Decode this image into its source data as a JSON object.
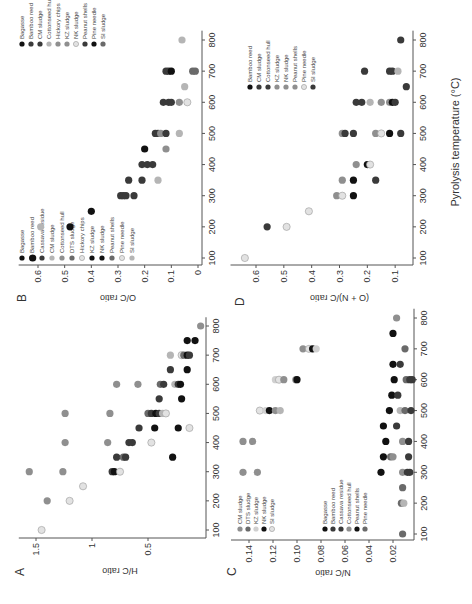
{
  "figure": {
    "xlabel": "Pyrolysis temperature (°C)",
    "panels": [
      "A",
      "B",
      "C",
      "D"
    ]
  },
  "colors": {
    "black": "#111111",
    "dark": "#3a3a3a",
    "mid": "#6a6a6a",
    "gray": "#8f8f8f",
    "light": "#b5b5b5",
    "open": "#e2e2e2"
  },
  "chart_data": [
    {
      "panel": "A",
      "type": "scatter",
      "title": "",
      "xlabel": "Pyrolysis temperature (°C)",
      "ylabel": "H/C ratio",
      "xlim": [
        70,
        830
      ],
      "ylim": [
        0,
        1.6
      ],
      "xticks": [
        100,
        200,
        300,
        400,
        500,
        600,
        700,
        800
      ],
      "yticks": [
        0.5,
        1,
        1.5
      ],
      "ytick_labels": [
        "0.5",
        "1",
        "1.5"
      ],
      "legend": [
        "Bagasse",
        "Bamboo reed",
        "Cassava residue",
        "CM sludge",
        "Cottonseed hull",
        "DTS sludge",
        "Hickory chips",
        "KZ sludge",
        "NK sludge",
        "Peanut shells",
        "Pine needle",
        "SI sludge"
      ],
      "legend_colors": [
        "#111111",
        "#3a3a3a",
        "#3a3a3a",
        "#b5b5b5",
        "#8f8f8f",
        "#6a6a6a",
        "#e2e2e2",
        "#111111",
        "#111111",
        "#6a6a6a",
        "#e2e2e2",
        "#b5b5b5"
      ],
      "points": [
        {
          "x": 100,
          "y": 1.45,
          "c": "#e2e2e2"
        },
        {
          "x": 200,
          "y": 1.4,
          "c": "#8f8f8f"
        },
        {
          "x": 200,
          "y": 1.2,
          "c": "#e2e2e2"
        },
        {
          "x": 250,
          "y": 1.08,
          "c": "#e2e2e2"
        },
        {
          "x": 300,
          "y": 1.56,
          "c": "#8f8f8f"
        },
        {
          "x": 300,
          "y": 1.26,
          "c": "#8f8f8f"
        },
        {
          "x": 300,
          "y": 0.82,
          "c": "#3a3a3a"
        },
        {
          "x": 300,
          "y": 0.8,
          "c": "#111111"
        },
        {
          "x": 300,
          "y": 0.75,
          "c": "#e2e2e2"
        },
        {
          "x": 350,
          "y": 0.78,
          "c": "#3a3a3a"
        },
        {
          "x": 350,
          "y": 0.72,
          "c": "#6a6a6a"
        },
        {
          "x": 350,
          "y": 0.7,
          "c": "#3a3a3a"
        },
        {
          "x": 350,
          "y": 0.28,
          "c": "#111111"
        },
        {
          "x": 400,
          "y": 1.24,
          "c": "#8f8f8f"
        },
        {
          "x": 400,
          "y": 0.86,
          "c": "#8f8f8f"
        },
        {
          "x": 400,
          "y": 0.67,
          "c": "#3a3a3a"
        },
        {
          "x": 400,
          "y": 0.64,
          "c": "#3a3a3a"
        },
        {
          "x": 400,
          "y": 0.47,
          "c": "#e2e2e2"
        },
        {
          "x": 450,
          "y": 0.58,
          "c": "#3a3a3a"
        },
        {
          "x": 450,
          "y": 0.44,
          "c": "#111111"
        },
        {
          "x": 450,
          "y": 0.23,
          "c": "#111111"
        },
        {
          "x": 450,
          "y": 0.13,
          "c": "#e2e2e2"
        },
        {
          "x": 500,
          "y": 1.24,
          "c": "#8f8f8f"
        },
        {
          "x": 500,
          "y": 0.84,
          "c": "#8f8f8f"
        },
        {
          "x": 500,
          "y": 0.5,
          "c": "#6a6a6a"
        },
        {
          "x": 500,
          "y": 0.47,
          "c": "#3a3a3a"
        },
        {
          "x": 500,
          "y": 0.43,
          "c": "#111111"
        },
        {
          "x": 500,
          "y": 0.4,
          "c": "#3a3a3a"
        },
        {
          "x": 500,
          "y": 0.37,
          "c": "#b5b5b5"
        },
        {
          "x": 500,
          "y": 0.34,
          "c": "#e2e2e2"
        },
        {
          "x": 550,
          "y": 0.4,
          "c": "#3a3a3a"
        },
        {
          "x": 550,
          "y": 0.2,
          "c": "#111111"
        },
        {
          "x": 600,
          "y": 0.78,
          "c": "#8f8f8f"
        },
        {
          "x": 600,
          "y": 0.59,
          "c": "#8f8f8f"
        },
        {
          "x": 600,
          "y": 0.39,
          "c": "#6a6a6a"
        },
        {
          "x": 600,
          "y": 0.36,
          "c": "#3a3a3a"
        },
        {
          "x": 600,
          "y": 0.26,
          "c": "#b5b5b5"
        },
        {
          "x": 600,
          "y": 0.23,
          "c": "#3a3a3a"
        },
        {
          "x": 600,
          "y": 0.21,
          "c": "#111111"
        },
        {
          "x": 650,
          "y": 0.3,
          "c": "#3a3a3a"
        },
        {
          "x": 650,
          "y": 0.15,
          "c": "#111111"
        },
        {
          "x": 700,
          "y": 0.3,
          "c": "#b5b5b5"
        },
        {
          "x": 700,
          "y": 0.2,
          "c": "#e2e2e2"
        },
        {
          "x": 700,
          "y": 0.18,
          "c": "#6a6a6a"
        },
        {
          "x": 700,
          "y": 0.15,
          "c": "#111111"
        },
        {
          "x": 700,
          "y": 0.13,
          "c": "#3a3a3a"
        },
        {
          "x": 750,
          "y": 0.15,
          "c": "#111111"
        },
        {
          "x": 750,
          "y": 0.08,
          "c": "#111111"
        },
        {
          "x": 800,
          "y": 0.03,
          "c": "#8f8f8f"
        }
      ]
    },
    {
      "panel": "B",
      "type": "scatter",
      "title": "",
      "xlabel": "Pyrolysis temperature (°C)",
      "ylabel": "O/C ratio",
      "xlim": [
        70,
        830
      ],
      "ylim": [
        0,
        0.65
      ],
      "xticks": [
        100,
        200,
        300,
        400,
        500,
        600,
        700,
        800
      ],
      "yticks": [
        0,
        0.1,
        0.2,
        0.3,
        0.4,
        0.5,
        0.6
      ],
      "ytick_labels": [
        "0",
        "0.1",
        "0.2",
        "0.3",
        "0.4",
        "0.5",
        "0.6"
      ],
      "legend": [
        "Bagasse",
        "Bamboo reed",
        "CM sludge",
        "Cottonseed hull",
        "Hickory chips",
        "KZ sludge",
        "NK sludge",
        "Peanut shells",
        "Pine needle",
        "SI sludge"
      ],
      "legend_colors": [
        "#111111",
        "#3a3a3a",
        "#3a3a3a",
        "#b5b5b5",
        "#8f8f8f",
        "#8f8f8f",
        "#e2e2e2",
        "#3a3a3a",
        "#111111",
        "#6a6a6a"
      ],
      "points": [
        {
          "x": 100,
          "y": 0.62,
          "c": "#111111"
        },
        {
          "x": 200,
          "y": 0.59,
          "c": "#b5b5b5"
        },
        {
          "x": 200,
          "y": 0.48,
          "c": "#111111"
        },
        {
          "x": 250,
          "y": 0.4,
          "c": "#111111"
        },
        {
          "x": 300,
          "y": 0.29,
          "c": "#3a3a3a"
        },
        {
          "x": 300,
          "y": 0.28,
          "c": "#3a3a3a"
        },
        {
          "x": 300,
          "y": 0.27,
          "c": "#3a3a3a"
        },
        {
          "x": 300,
          "y": 0.24,
          "c": "#3a3a3a"
        },
        {
          "x": 350,
          "y": 0.26,
          "c": "#3a3a3a"
        },
        {
          "x": 350,
          "y": 0.21,
          "c": "#3a3a3a"
        },
        {
          "x": 350,
          "y": 0.15,
          "c": "#b5b5b5"
        },
        {
          "x": 400,
          "y": 0.21,
          "c": "#3a3a3a"
        },
        {
          "x": 400,
          "y": 0.19,
          "c": "#3a3a3a"
        },
        {
          "x": 400,
          "y": 0.17,
          "c": "#3a3a3a"
        },
        {
          "x": 450,
          "y": 0.2,
          "c": "#111111"
        },
        {
          "x": 450,
          "y": 0.12,
          "c": "#8f8f8f"
        },
        {
          "x": 500,
          "y": 0.16,
          "c": "#3a3a3a"
        },
        {
          "x": 500,
          "y": 0.15,
          "c": "#3a3a3a"
        },
        {
          "x": 500,
          "y": 0.14,
          "c": "#8f8f8f"
        },
        {
          "x": 500,
          "y": 0.12,
          "c": "#3a3a3a"
        },
        {
          "x": 500,
          "y": 0.07,
          "c": "#b5b5b5"
        },
        {
          "x": 600,
          "y": 0.13,
          "c": "#3a3a3a"
        },
        {
          "x": 600,
          "y": 0.11,
          "c": "#3a3a3a"
        },
        {
          "x": 600,
          "y": 0.1,
          "c": "#3a3a3a"
        },
        {
          "x": 600,
          "y": 0.07,
          "c": "#8f8f8f"
        },
        {
          "x": 600,
          "y": 0.04,
          "c": "#e2e2e2"
        },
        {
          "x": 650,
          "y": 0.05,
          "c": "#b5b5b5"
        },
        {
          "x": 700,
          "y": 0.12,
          "c": "#3a3a3a"
        },
        {
          "x": 700,
          "y": 0.11,
          "c": "#3a3a3a"
        },
        {
          "x": 700,
          "y": 0.1,
          "c": "#111111"
        },
        {
          "x": 700,
          "y": 0.02,
          "c": "#6a6a6a"
        },
        {
          "x": 700,
          "y": 0.01,
          "c": "#6a6a6a"
        },
        {
          "x": 800,
          "y": 0.06,
          "c": "#b5b5b5"
        }
      ]
    },
    {
      "panel": "C",
      "type": "scatter",
      "title": "",
      "xlabel": "Pyrolysis temperature (°C)",
      "ylabel": "N/C ratio",
      "xlim": [
        70,
        830
      ],
      "ylim": [
        0,
        0.15
      ],
      "xticks": [
        100,
        200,
        300,
        400,
        500,
        600,
        700,
        800
      ],
      "yticks": [
        0.02,
        0.04,
        0.06,
        0.08,
        0.1,
        0.12,
        0.14
      ],
      "ytick_labels": [
        "0.02",
        "0.04",
        "0.06",
        "0.08",
        "0.10",
        "0.12",
        "0.14"
      ],
      "legend": [
        "CM sludge",
        "DTS sludge",
        "KZ sludge",
        "NK sludge",
        "SI sludge",
        "Bagasse",
        "Bamboo reed",
        "Cassava residue",
        "Cottonseed hull",
        "Peanut shells",
        "Pine needle"
      ],
      "legend_colors": [
        "#8f8f8f",
        "#6a6a6a",
        "#d0d0d0",
        "#111111",
        "#e2e2e2",
        "#111111",
        "#3a3a3a",
        "#3a3a3a",
        "#8f8f8f",
        "#111111",
        "#6a6a6a"
      ],
      "points": [
        {
          "x": 100,
          "y": 0.012,
          "c": "#6a6a6a"
        },
        {
          "x": 200,
          "y": 0.013,
          "c": "#6a6a6a"
        },
        {
          "x": 200,
          "y": 0.011,
          "c": "#b5b5b5"
        },
        {
          "x": 250,
          "y": 0.012,
          "c": "#6a6a6a"
        },
        {
          "x": 300,
          "y": 0.145,
          "c": "#8f8f8f"
        },
        {
          "x": 300,
          "y": 0.133,
          "c": "#8f8f8f"
        },
        {
          "x": 300,
          "y": 0.03,
          "c": "#111111"
        },
        {
          "x": 300,
          "y": 0.012,
          "c": "#8f8f8f"
        },
        {
          "x": 300,
          "y": 0.008,
          "c": "#3a3a3a"
        },
        {
          "x": 300,
          "y": 0.006,
          "c": "#3a3a3a"
        },
        {
          "x": 350,
          "y": 0.028,
          "c": "#111111"
        },
        {
          "x": 350,
          "y": 0.022,
          "c": "#6a6a6a"
        },
        {
          "x": 350,
          "y": 0.02,
          "c": "#8f8f8f"
        },
        {
          "x": 350,
          "y": 0.007,
          "c": "#3a3a3a"
        },
        {
          "x": 400,
          "y": 0.145,
          "c": "#8f8f8f"
        },
        {
          "x": 400,
          "y": 0.137,
          "c": "#8f8f8f"
        },
        {
          "x": 400,
          "y": 0.026,
          "c": "#111111"
        },
        {
          "x": 400,
          "y": 0.012,
          "c": "#8f8f8f"
        },
        {
          "x": 400,
          "y": 0.007,
          "c": "#3a3a3a"
        },
        {
          "x": 450,
          "y": 0.028,
          "c": "#111111"
        },
        {
          "x": 450,
          "y": 0.017,
          "c": "#3a3a3a"
        },
        {
          "x": 500,
          "y": 0.131,
          "c": "#e2e2e2"
        },
        {
          "x": 500,
          "y": 0.126,
          "c": "#d0d0d0"
        },
        {
          "x": 500,
          "y": 0.123,
          "c": "#111111"
        },
        {
          "x": 500,
          "y": 0.118,
          "c": "#8f8f8f"
        },
        {
          "x": 500,
          "y": 0.114,
          "c": "#b5b5b5"
        },
        {
          "x": 500,
          "y": 0.023,
          "c": "#111111"
        },
        {
          "x": 500,
          "y": 0.014,
          "c": "#b5b5b5"
        },
        {
          "x": 500,
          "y": 0.01,
          "c": "#6a6a6a"
        },
        {
          "x": 500,
          "y": 0.005,
          "c": "#3a3a3a"
        },
        {
          "x": 550,
          "y": 0.021,
          "c": "#111111"
        },
        {
          "x": 550,
          "y": 0.016,
          "c": "#3a3a3a"
        },
        {
          "x": 600,
          "y": 0.118,
          "c": "#d0d0d0"
        },
        {
          "x": 600,
          "y": 0.115,
          "c": "#e2e2e2"
        },
        {
          "x": 600,
          "y": 0.111,
          "c": "#8f8f8f"
        },
        {
          "x": 600,
          "y": 0.101,
          "c": "#8f8f8f"
        },
        {
          "x": 600,
          "y": 0.1,
          "c": "#111111"
        },
        {
          "x": 600,
          "y": 0.019,
          "c": "#111111"
        },
        {
          "x": 600,
          "y": 0.009,
          "c": "#6a6a6a"
        },
        {
          "x": 600,
          "y": 0.006,
          "c": "#3a3a3a"
        },
        {
          "x": 600,
          "y": 0.004,
          "c": "#3a3a3a"
        },
        {
          "x": 650,
          "y": 0.02,
          "c": "#111111"
        },
        {
          "x": 650,
          "y": 0.014,
          "c": "#3a3a3a"
        },
        {
          "x": 700,
          "y": 0.095,
          "c": "#8f8f8f"
        },
        {
          "x": 700,
          "y": 0.09,
          "c": "#e2e2e2"
        },
        {
          "x": 700,
          "y": 0.087,
          "c": "#111111"
        },
        {
          "x": 700,
          "y": 0.084,
          "c": "#d0d0d0"
        },
        {
          "x": 700,
          "y": 0.01,
          "c": "#6a6a6a"
        },
        {
          "x": 750,
          "y": 0.02,
          "c": "#111111"
        },
        {
          "x": 800,
          "y": 0.017,
          "c": "#8f8f8f"
        }
      ]
    },
    {
      "panel": "D",
      "type": "scatter",
      "title": "",
      "xlabel": "Pyrolysis temperature (°C)",
      "ylabel": "(O + N)/C ratio",
      "xlim": [
        70,
        830
      ],
      "ylim": [
        0.04,
        0.67
      ],
      "xticks": [
        100,
        200,
        300,
        400,
        500,
        600,
        700,
        800
      ],
      "yticks": [
        0.1,
        0.2,
        0.3,
        0.4,
        0.5,
        0.6
      ],
      "ytick_labels": [
        "0.1",
        "0.2",
        "0.3",
        "0.4",
        "0.5",
        "0.6"
      ],
      "legend": [
        "Bamboo reed",
        "CM sludge",
        "Cottonseed hull",
        "KZ sludge",
        "NK sludge",
        "Peanut shells",
        "Pine needle",
        "SI sludge"
      ],
      "legend_colors": [
        "#111111",
        "#3a3a3a",
        "#3a3a3a",
        "#8f8f8f",
        "#8f8f8f",
        "#8f8f8f",
        "#e2e2e2",
        "#3a3a3a"
      ],
      "points": [
        {
          "x": 100,
          "y": 0.64,
          "c": "#e2e2e2"
        },
        {
          "x": 200,
          "y": 0.56,
          "c": "#3a3a3a"
        },
        {
          "x": 200,
          "y": 0.49,
          "c": "#e2e2e2"
        },
        {
          "x": 250,
          "y": 0.41,
          "c": "#e2e2e2"
        },
        {
          "x": 300,
          "y": 0.31,
          "c": "#8f8f8f"
        },
        {
          "x": 300,
          "y": 0.29,
          "c": "#e2e2e2"
        },
        {
          "x": 300,
          "y": 0.25,
          "c": "#111111"
        },
        {
          "x": 350,
          "y": 0.29,
          "c": "#8f8f8f"
        },
        {
          "x": 350,
          "y": 0.25,
          "c": "#111111"
        },
        {
          "x": 350,
          "y": 0.17,
          "c": "#3a3a3a"
        },
        {
          "x": 400,
          "y": 0.24,
          "c": "#8f8f8f"
        },
        {
          "x": 400,
          "y": 0.2,
          "c": "#111111"
        },
        {
          "x": 400,
          "y": 0.19,
          "c": "#e2e2e2"
        },
        {
          "x": 500,
          "y": 0.29,
          "c": "#8f8f8f"
        },
        {
          "x": 500,
          "y": 0.28,
          "c": "#3a3a3a"
        },
        {
          "x": 500,
          "y": 0.25,
          "c": "#3a3a3a"
        },
        {
          "x": 500,
          "y": 0.17,
          "c": "#8f8f8f"
        },
        {
          "x": 500,
          "y": 0.15,
          "c": "#e2e2e2"
        },
        {
          "x": 500,
          "y": 0.12,
          "c": "#111111"
        },
        {
          "x": 500,
          "y": 0.08,
          "c": "#3a3a3a"
        },
        {
          "x": 600,
          "y": 0.24,
          "c": "#3a3a3a"
        },
        {
          "x": 600,
          "y": 0.22,
          "c": "#3a3a3a"
        },
        {
          "x": 600,
          "y": 0.19,
          "c": "#b5b5b5"
        },
        {
          "x": 600,
          "y": 0.15,
          "c": "#8f8f8f"
        },
        {
          "x": 600,
          "y": 0.12,
          "c": "#8f8f8f"
        },
        {
          "x": 600,
          "y": 0.11,
          "c": "#111111"
        },
        {
          "x": 600,
          "y": 0.1,
          "c": "#3a3a3a"
        },
        {
          "x": 650,
          "y": 0.06,
          "c": "#3a3a3a"
        },
        {
          "x": 700,
          "y": 0.21,
          "c": "#3a3a3a"
        },
        {
          "x": 700,
          "y": 0.12,
          "c": "#3a3a3a"
        },
        {
          "x": 700,
          "y": 0.11,
          "c": "#3a3a3a"
        },
        {
          "x": 700,
          "y": 0.09,
          "c": "#b5b5b5"
        },
        {
          "x": 800,
          "y": 0.08,
          "c": "#3a3a3a"
        }
      ]
    }
  ]
}
